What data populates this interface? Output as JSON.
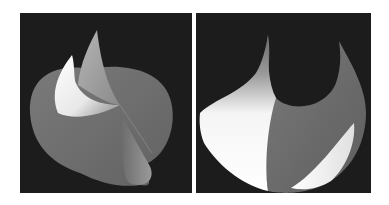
{
  "figure": {
    "panels": [
      {
        "id": "left",
        "description": "rendered 3D surface with two curled horn-like sheets over a disc",
        "background": "#1c1c1c"
      },
      {
        "id": "right",
        "description": "rendered 3D surface, disc with upward-curled edges forming two horns",
        "background": "#1c1c1c"
      }
    ],
    "colors": {
      "background": "#ffffff",
      "panel": "#1c1c1c",
      "surface_mid": "#6e6e6e",
      "surface_light": "#ffffff",
      "surface_dark": "#555555"
    }
  }
}
